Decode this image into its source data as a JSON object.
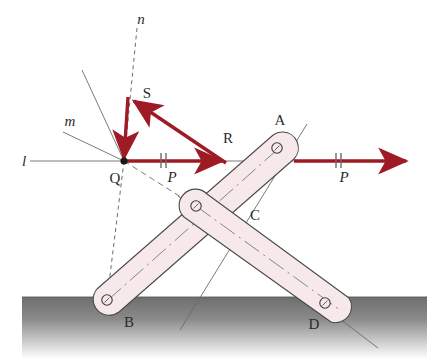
{
  "figure": {
    "background_color": "#ffffff"
  },
  "colors": {
    "force_vector": "#9e1b26",
    "link_fill": "#f7e9e9",
    "link_stroke": "#4a4a4a",
    "construction_line": "#6b6b6b",
    "ground_dark": "#6e6e6e",
    "ground_light": "#ffffff",
    "label_color": "#2b2b2b"
  },
  "labels": {
    "line_l": "l",
    "line_m": "m",
    "line_n": "n",
    "point_q": "Q",
    "point_s": "S",
    "point_r": "R",
    "joint_a": "A",
    "joint_b": "B",
    "joint_c": "C",
    "joint_d": "D",
    "force_p_left": "P",
    "force_p_right": "P"
  },
  "vectors": [
    {
      "name": "P-left",
      "label": "P",
      "from": "Q",
      "to": "R",
      "direction": "right",
      "tick_marks": 2,
      "color": "#9e1b26"
    },
    {
      "name": "R",
      "label": "R",
      "from": "R",
      "to": "S",
      "direction": "up-left",
      "tick_marks": 0,
      "color": "#9e1b26"
    },
    {
      "name": "S",
      "label": "S",
      "from": "S",
      "to": "Q",
      "direction": "down",
      "tick_marks": 0,
      "color": "#9e1b26"
    },
    {
      "name": "P-right",
      "label": "P",
      "from": "A",
      "to": "right-edge",
      "direction": "right",
      "tick_marks": 2,
      "color": "#9e1b26"
    }
  ],
  "construction_lines": [
    {
      "name": "l",
      "style": "solid",
      "label": "l"
    },
    {
      "name": "m",
      "style": "solid",
      "label": "m"
    },
    {
      "name": "n",
      "style": "dashed",
      "label": "n"
    }
  ],
  "links": [
    {
      "name": "link-AB",
      "ends": [
        "A",
        "B"
      ],
      "pins": [
        "A",
        "C",
        "B"
      ]
    },
    {
      "name": "link-CD",
      "ends": [
        "C",
        "D"
      ],
      "pins": [
        "C",
        "D"
      ]
    }
  ],
  "joints": [
    {
      "name": "A",
      "label": "A"
    },
    {
      "name": "B",
      "label": "B"
    },
    {
      "name": "C",
      "label": "C"
    },
    {
      "name": "D",
      "label": "D"
    }
  ]
}
